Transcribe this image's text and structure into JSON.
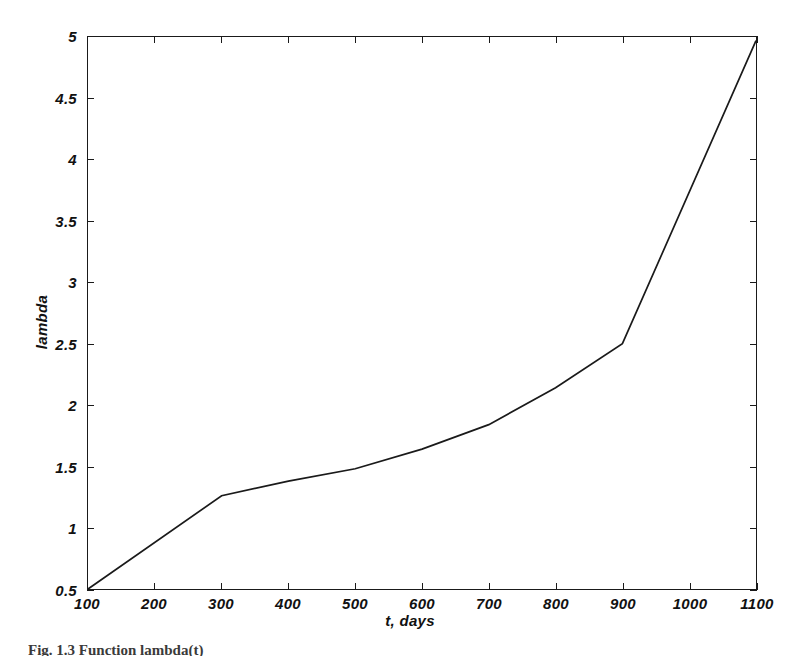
{
  "figure": {
    "background_color": "#ffffff",
    "line_color": "#1a1a1a",
    "axis_color": "#1a1a1a",
    "caption_partial": "Fig. 1.3 Function lambda(t)"
  },
  "chart_data": {
    "type": "line",
    "title": "",
    "xlabel": "t, days",
    "ylabel": "lambda",
    "xlim": [
      100,
      1100
    ],
    "ylim": [
      0.5,
      5
    ],
    "grid": false,
    "legend": null,
    "x_ticks": [
      100,
      200,
      300,
      400,
      500,
      600,
      700,
      800,
      900,
      1000,
      1100
    ],
    "x_tick_labels": [
      "100",
      "200",
      "300",
      "400",
      "500",
      "600",
      "700",
      "800",
      "900",
      "1000",
      "1100"
    ],
    "y_ticks": [
      0.5,
      1,
      1.5,
      2,
      2.5,
      3,
      3.5,
      4,
      4.5,
      5
    ],
    "y_tick_labels": [
      "0.5",
      "1",
      "1.5",
      "2",
      "2.5",
      "3",
      "3.5",
      "4",
      "4.5",
      "5"
    ],
    "series": [
      {
        "name": "lambda",
        "x": [
          100,
          300,
          400,
          500,
          600,
          700,
          800,
          900,
          1100
        ],
        "values": [
          0.5,
          1.26,
          1.38,
          1.48,
          1.64,
          1.84,
          2.14,
          2.5,
          4.97
        ]
      }
    ]
  }
}
